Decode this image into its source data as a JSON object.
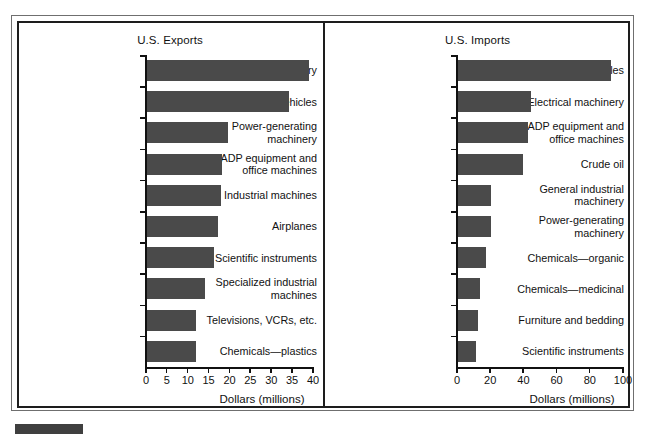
{
  "figure": {
    "background_color": "#ffffff",
    "bar_color": "#4a4a4a",
    "axis_color": "#111111",
    "frame_color": "#1d1d1d"
  },
  "chart_data": [
    {
      "type": "bar",
      "orientation": "horizontal",
      "title": "U.S. Exports",
      "xlabel": "Dollars (millions)",
      "ylabel": "",
      "xlim": [
        0,
        40
      ],
      "xticks": [
        0,
        5,
        10,
        15,
        20,
        25,
        30,
        35,
        40
      ],
      "xticklabels": [
        "0",
        "5",
        "10",
        "15",
        "20",
        "25",
        "30",
        "35",
        "40"
      ],
      "grid": false,
      "legend": "none",
      "categories": [
        "Electrical machinery",
        "Vehicles",
        "Power-generating machinery",
        "ADP equipment and office machines",
        "Industrial machines",
        "Airplanes",
        "Scientific instruments",
        "Specialized industrial machines",
        "Televisions, VCRs, etc.",
        "Chemicals—plastics"
      ],
      "category_lines": [
        [
          "Electrical machinery"
        ],
        [
          "Vehicles"
        ],
        [
          "Power-generating",
          "machinery"
        ],
        [
          "ADP equipment and",
          "office machines"
        ],
        [
          "Industrial machines"
        ],
        [
          "Airplanes"
        ],
        [
          "Scientific instruments"
        ],
        [
          "Specialized industrial",
          "machines"
        ],
        [
          "Televisions, VCRs, etc."
        ],
        [
          "Chemicals—plastics"
        ]
      ],
      "values": [
        38.8,
        34,
        19.3,
        18,
        17.8,
        17,
        16,
        14,
        11.7,
        11.7
      ]
    },
    {
      "type": "bar",
      "orientation": "horizontal",
      "title": "U.S. Imports",
      "xlabel": "Dollars (millions)",
      "ylabel": "",
      "xlim": [
        0,
        100
      ],
      "xticks": [
        0,
        20,
        40,
        60,
        80,
        100
      ],
      "xticklabels": [
        "0",
        "20",
        "40",
        "60",
        "80",
        "100"
      ],
      "grid": false,
      "legend": "none",
      "categories": [
        "Vehicles",
        "Electrical machinery",
        "ADP equipment and office machines",
        "Crude oil",
        "General industrial machinery",
        "Power-generating machinery",
        "Chemicals—organic",
        "Chemicals—medicinal",
        "Furniture and bedding",
        "Scientific instruments"
      ],
      "category_lines": [
        [
          "Vehicles"
        ],
        [
          "Electrical machinery"
        ],
        [
          "ADP equipment and",
          "office machines"
        ],
        [
          "Crude oil"
        ],
        [
          "General industrial",
          "machinery"
        ],
        [
          "Power-generating",
          "machinery"
        ],
        [
          "Chemicals—organic"
        ],
        [
          "Chemicals—medicinal"
        ],
        [
          "Furniture and bedding"
        ],
        [
          "Scientific instruments"
        ]
      ],
      "values": [
        92,
        44,
        42,
        39,
        20,
        20,
        17,
        13,
        12,
        11
      ]
    }
  ]
}
